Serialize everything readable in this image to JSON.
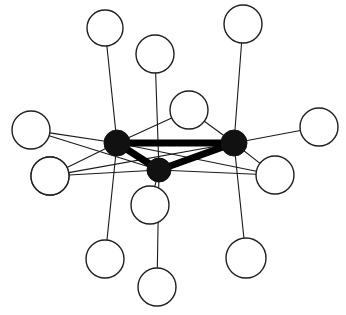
{
  "figure": {
    "width": 346,
    "height": 315,
    "background_color": "#ffffff"
  },
  "style": {
    "hub_fill": "#111111",
    "hub_stroke": "#111111",
    "leaf_fill": "#ffffff",
    "leaf_stroke": "#1f1f1f",
    "leaf_stroke_width": 1.4,
    "core_edge_color": "#000000",
    "core_edge_width": 7,
    "spoke_edge_color": "#1a1a1a",
    "spoke_edge_width": 1.1
  },
  "graph_data": {
    "type": "node-link-diagram",
    "node_count": 16,
    "hub_count": 3,
    "leaf_count": 13,
    "edge_count": 18,
    "hubs": [
      {
        "id": "H1",
        "label": "left-hub",
        "cx": 117,
        "cy": 143,
        "r": 13
      },
      {
        "id": "H2",
        "label": "right-hub",
        "cx": 234,
        "cy": 143,
        "r": 13
      },
      {
        "id": "H3",
        "label": "bottom-hub",
        "cx": 159,
        "cy": 170,
        "r": 12
      }
    ],
    "leaves": [
      {
        "id": "L1",
        "label": "top-left-leaf",
        "cx": 105,
        "cy": 28,
        "r": 18
      },
      {
        "id": "L2",
        "label": "top-mid-leaf",
        "cx": 155,
        "cy": 54,
        "r": 19
      },
      {
        "id": "L3",
        "label": "top-right-leaf",
        "cx": 243,
        "cy": 24,
        "r": 19
      },
      {
        "id": "L4",
        "label": "left-upper-leaf",
        "cx": 31,
        "cy": 130,
        "r": 19
      },
      {
        "id": "L5",
        "label": "left-lower-leaf",
        "cx": 50,
        "cy": 176,
        "r": 19
      },
      {
        "id": "L6",
        "label": "center-upper-leaf",
        "cx": 189,
        "cy": 110,
        "r": 19
      },
      {
        "id": "L7",
        "label": "center-lower-leaf",
        "cx": 150,
        "cy": 205,
        "r": 19
      },
      {
        "id": "L8",
        "label": "right-upper-leaf",
        "cx": 319,
        "cy": 127,
        "r": 19
      },
      {
        "id": "L9",
        "label": "right-lower-leaf",
        "cx": 275,
        "cy": 175,
        "r": 19
      },
      {
        "id": "L10",
        "label": "bottom-left-leaf",
        "cx": 105,
        "cy": 259,
        "r": 19
      },
      {
        "id": "L11",
        "label": "bottom-mid-leaf",
        "cx": 157,
        "cy": 287,
        "r": 19
      },
      {
        "id": "L12",
        "label": "bottom-right-leaf",
        "cx": 246,
        "cy": 258,
        "r": 20
      },
      {
        "id": "L13",
        "label": "far-left-lower-leaf",
        "cx": 50,
        "cy": 176,
        "r": 19
      }
    ],
    "core_edges": [
      {
        "source": "H1",
        "target": "H2",
        "weight": "thick"
      },
      {
        "source": "H1",
        "target": "H3",
        "weight": "thick"
      },
      {
        "source": "H3",
        "target": "H2",
        "weight": "thick"
      }
    ],
    "spoke_edges": [
      {
        "source": "H1",
        "target": "L1",
        "weight": "thin"
      },
      {
        "source": "H1",
        "target": "L4",
        "weight": "thin"
      },
      {
        "source": "H1",
        "target": "L5",
        "weight": "thin"
      },
      {
        "source": "H1",
        "target": "L10",
        "weight": "thin"
      },
      {
        "source": "H1",
        "target": "L6",
        "weight": "thin"
      },
      {
        "source": "H1",
        "target": "L9",
        "weight": "thin"
      },
      {
        "source": "H2",
        "target": "L3",
        "weight": "thin"
      },
      {
        "source": "H2",
        "target": "L8",
        "weight": "thin"
      },
      {
        "source": "H2",
        "target": "L6",
        "weight": "thin"
      },
      {
        "source": "H2",
        "target": "L9",
        "weight": "thin"
      },
      {
        "source": "H2",
        "target": "L12",
        "weight": "thin"
      },
      {
        "source": "H2",
        "target": "L5",
        "weight": "thin"
      },
      {
        "source": "H3",
        "target": "L2",
        "weight": "thin"
      },
      {
        "source": "H3",
        "target": "L7",
        "weight": "thin"
      },
      {
        "source": "H3",
        "target": "L11",
        "weight": "thin"
      },
      {
        "source": "H3",
        "target": "L5",
        "weight": "thin"
      },
      {
        "source": "H3",
        "target": "L9",
        "weight": "thin"
      },
      {
        "source": "H3",
        "target": "L4",
        "weight": "thin"
      }
    ]
  }
}
